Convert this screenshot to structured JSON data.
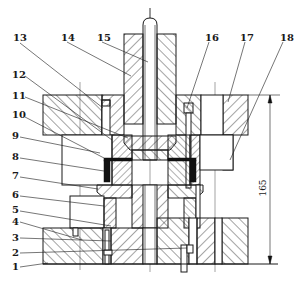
{
  "figure": {
    "labels": {
      "p1": "1",
      "p2": "2",
      "p3": "3",
      "p4": "4",
      "p5": "5",
      "p6": "6",
      "p7": "7",
      "p8": "8",
      "p9": "9",
      "p10": "10",
      "p11": "11",
      "p12": "12",
      "p13": "13",
      "p14": "14",
      "p15": "15",
      "p16": "16",
      "p17": "17",
      "p18": "18"
    },
    "dimension": {
      "value": "165",
      "orientation": "vertical"
    }
  }
}
